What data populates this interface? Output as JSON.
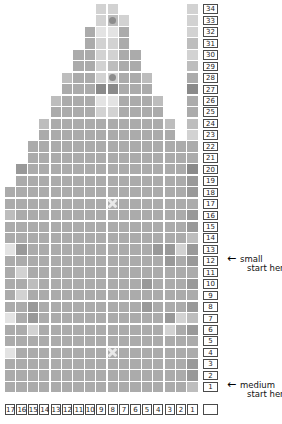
{
  "chart_data": {
    "type": "heatmap",
    "title": "",
    "subtitle": "",
    "xlabel": "",
    "ylabel": "",
    "grid": true,
    "legend_position": "right",
    "row_labels": [
      "34",
      "33",
      "32",
      "31",
      "30",
      "29",
      "28",
      "27",
      "26",
      "25",
      "24",
      "23",
      "22",
      "21",
      "20",
      "19",
      "18",
      "17",
      "16",
      "15",
      "14",
      "13",
      "12",
      "11",
      "10",
      "9",
      "8",
      "7",
      "6",
      "5",
      "4",
      "3",
      "2",
      "1"
    ],
    "column_labels": [
      "17",
      "16",
      "15",
      "14",
      "13",
      "12",
      "11",
      "10",
      "9",
      "8",
      "7",
      "6",
      "5",
      "4",
      "3",
      "2",
      "1"
    ],
    "n_rows": 34,
    "n_cols": 17,
    "palette": {
      "light": "#e3e3e3",
      "pale": "#d2d2d2",
      "mid": "#bdbdbd",
      "base": "#ababab",
      "dark": "#999999",
      "darker": "#8a8a8a",
      "grid_line": "#ffffff",
      "label_border": "#4a4a4a",
      "text": "#111111",
      "marker_dot": "#8d8d8d",
      "marker_x": "#e9e9e9",
      "background": "#ffffff"
    },
    "markers": [
      {
        "row": 33,
        "col_index": 9,
        "symbol": "dot",
        "name": "circle-marker"
      },
      {
        "row": 28,
        "col_index": 9,
        "symbol": "dot",
        "name": "circle-marker"
      },
      {
        "row": 17,
        "col_index": 9,
        "symbol": "x",
        "name": "x-marker"
      },
      {
        "row": 4,
        "col_index": 9,
        "symbol": "x",
        "name": "x-marker"
      }
    ],
    "rows": [
      {
        "row": 34,
        "start": 8,
        "width": 2,
        "shades": [
          "pale",
          "pale"
        ]
      },
      {
        "row": 33,
        "start": 8,
        "width": 3,
        "shades": [
          "pale",
          "mid",
          "pale"
        ]
      },
      {
        "row": 32,
        "start": 7,
        "width": 4,
        "shades": [
          "base",
          "light",
          "light",
          "base"
        ]
      },
      {
        "row": 31,
        "start": 7,
        "width": 4,
        "shades": [
          "base",
          "pale",
          "pale",
          "base"
        ]
      },
      {
        "row": 30,
        "start": 6,
        "width": 6,
        "shades": [
          "base",
          "base",
          "pale",
          "pale",
          "base",
          "base"
        ]
      },
      {
        "row": 29,
        "start": 6,
        "width": 6,
        "shades": [
          "base",
          "base",
          "pale",
          "mid",
          "base",
          "base"
        ]
      },
      {
        "row": 28,
        "start": 5,
        "width": 8,
        "shades": [
          "mid",
          "base",
          "base",
          "pale",
          "pale",
          "base",
          "base",
          "mid"
        ]
      },
      {
        "row": 27,
        "start": 5,
        "width": 8,
        "shades": [
          "base",
          "base",
          "base",
          "darker",
          "darker",
          "base",
          "base",
          "base"
        ]
      },
      {
        "row": 26,
        "start": 4,
        "width": 10,
        "shades": [
          "mid",
          "base",
          "base",
          "base",
          "light",
          "light",
          "base",
          "base",
          "base",
          "mid"
        ]
      },
      {
        "row": 25,
        "start": 4,
        "width": 10,
        "shades": [
          "base",
          "base",
          "base",
          "base",
          "pale",
          "pale",
          "base",
          "base",
          "base",
          "base"
        ]
      },
      {
        "row": 24,
        "start": 3,
        "width": 12,
        "shades": [
          "mid",
          "base",
          "base",
          "base",
          "base",
          "base",
          "base",
          "base",
          "base",
          "base",
          "base",
          "mid"
        ]
      },
      {
        "row": 23,
        "start": 3,
        "width": 12,
        "shades": [
          "base",
          "base",
          "base",
          "base",
          "base",
          "base",
          "base",
          "base",
          "base",
          "base",
          "base",
          "base"
        ]
      },
      {
        "row": 22,
        "start": 2,
        "width": 14,
        "shades": [
          "base",
          "base",
          "base",
          "base",
          "base",
          "base",
          "base",
          "base",
          "base",
          "base",
          "base",
          "base",
          "base",
          "base"
        ]
      },
      {
        "row": 21,
        "start": 2,
        "width": 14,
        "shades": [
          "base",
          "base",
          "base",
          "base",
          "base",
          "base",
          "base",
          "base",
          "base",
          "base",
          "base",
          "base",
          "base",
          "base"
        ]
      },
      {
        "row": 20,
        "start": 1,
        "width": 16,
        "shades": [
          "dark",
          "base",
          "base",
          "base",
          "base",
          "base",
          "base",
          "base",
          "base",
          "base",
          "base",
          "base",
          "base",
          "base",
          "base",
          "dark"
        ]
      },
      {
        "row": 19,
        "start": 1,
        "width": 16,
        "shades": [
          "base",
          "base",
          "base",
          "base",
          "base",
          "base",
          "base",
          "base",
          "base",
          "base",
          "base",
          "base",
          "base",
          "base",
          "base",
          "base"
        ]
      },
      {
        "row": 18,
        "start": 0,
        "width": 17,
        "shades": [
          "base",
          "base",
          "base",
          "base",
          "base",
          "base",
          "base",
          "base",
          "base",
          "base",
          "base",
          "base",
          "base",
          "base",
          "base",
          "base",
          "base"
        ]
      },
      {
        "row": 17,
        "start": 0,
        "width": 17,
        "shades": [
          "base",
          "base",
          "base",
          "base",
          "base",
          "base",
          "base",
          "base",
          "base",
          "base",
          "base",
          "base",
          "base",
          "base",
          "base",
          "base",
          "base"
        ]
      },
      {
        "row": 16,
        "start": 0,
        "width": 17,
        "shades": [
          "mid",
          "base",
          "base",
          "base",
          "base",
          "base",
          "base",
          "base",
          "base",
          "base",
          "base",
          "base",
          "base",
          "base",
          "base",
          "base",
          "mid"
        ]
      },
      {
        "row": 15,
        "start": 0,
        "width": 17,
        "shades": [
          "base",
          "base",
          "base",
          "base",
          "base",
          "base",
          "base",
          "base",
          "base",
          "base",
          "base",
          "base",
          "base",
          "base",
          "base",
          "base",
          "base"
        ]
      },
      {
        "row": 14,
        "start": 0,
        "width": 17,
        "shades": [
          "base",
          "base",
          "base",
          "base",
          "base",
          "base",
          "base",
          "base",
          "base",
          "base",
          "base",
          "base",
          "base",
          "base",
          "base",
          "base",
          "base"
        ]
      },
      {
        "row": 13,
        "start": 0,
        "width": 17,
        "shades": [
          "light",
          "dark",
          "base",
          "base",
          "base",
          "base",
          "base",
          "base",
          "base",
          "base",
          "base",
          "base",
          "base",
          "dark",
          "dark",
          "pale",
          "light"
        ]
      },
      {
        "row": 12,
        "start": 0,
        "width": 17,
        "shades": [
          "base",
          "base",
          "base",
          "base",
          "base",
          "base",
          "base",
          "base",
          "base",
          "base",
          "base",
          "base",
          "base",
          "base",
          "dark",
          "base",
          "base"
        ]
      },
      {
        "row": 11,
        "start": 0,
        "width": 17,
        "shades": [
          "base",
          "pale",
          "base",
          "base",
          "base",
          "base",
          "base",
          "base",
          "base",
          "base",
          "base",
          "base",
          "base",
          "base",
          "base",
          "base",
          "base"
        ]
      },
      {
        "row": 10,
        "start": 0,
        "width": 17,
        "shades": [
          "base",
          "base",
          "mid",
          "base",
          "base",
          "base",
          "base",
          "base",
          "base",
          "base",
          "base",
          "base",
          "dark",
          "base",
          "base",
          "base",
          "base"
        ]
      },
      {
        "row": 9,
        "start": 0,
        "width": 17,
        "shades": [
          "base",
          "pale",
          "base",
          "base",
          "base",
          "base",
          "base",
          "base",
          "base",
          "base",
          "base",
          "base",
          "base",
          "base",
          "base",
          "base",
          "base"
        ]
      },
      {
        "row": 8,
        "start": 0,
        "width": 17,
        "shades": [
          "base",
          "base",
          "dark",
          "base",
          "base",
          "base",
          "base",
          "base",
          "base",
          "base",
          "base",
          "base",
          "dark",
          "base",
          "base",
          "base",
          "base"
        ]
      },
      {
        "row": 7,
        "start": 0,
        "width": 17,
        "shades": [
          "light",
          "base",
          "dark",
          "base",
          "base",
          "base",
          "base",
          "base",
          "base",
          "base",
          "base",
          "base",
          "base",
          "base",
          "dark",
          "pale",
          "light"
        ]
      },
      {
        "row": 6,
        "start": 0,
        "width": 17,
        "shades": [
          "base",
          "base",
          "pale",
          "base",
          "base",
          "base",
          "base",
          "base",
          "base",
          "base",
          "base",
          "base",
          "base",
          "base",
          "pale",
          "base",
          "base"
        ]
      },
      {
        "row": 5,
        "start": 0,
        "width": 17,
        "shades": [
          "base",
          "base",
          "base",
          "base",
          "base",
          "base",
          "base",
          "base",
          "base",
          "base",
          "base",
          "base",
          "base",
          "base",
          "base",
          "base",
          "base"
        ]
      },
      {
        "row": 4,
        "start": 0,
        "width": 17,
        "shades": [
          "light",
          "base",
          "base",
          "base",
          "base",
          "base",
          "base",
          "base",
          "base",
          "base",
          "base",
          "base",
          "base",
          "base",
          "base",
          "base",
          "light"
        ]
      },
      {
        "row": 3,
        "start": 0,
        "width": 17,
        "shades": [
          "base",
          "base",
          "base",
          "base",
          "base",
          "base",
          "base",
          "base",
          "base",
          "base",
          "base",
          "base",
          "base",
          "base",
          "base",
          "base",
          "base"
        ]
      },
      {
        "row": 2,
        "start": 0,
        "width": 17,
        "shades": [
          "base",
          "base",
          "base",
          "base",
          "base",
          "base",
          "base",
          "base",
          "base",
          "base",
          "base",
          "base",
          "base",
          "base",
          "base",
          "base",
          "base"
        ]
      },
      {
        "row": 1,
        "start": 0,
        "width": 17,
        "shades": [
          "base",
          "base",
          "base",
          "base",
          "base",
          "base",
          "base",
          "base",
          "base",
          "base",
          "base",
          "base",
          "base",
          "base",
          "base",
          "base",
          "base"
        ]
      }
    ],
    "row_swatch_shades": {
      "34": "pale",
      "33": "pale",
      "32": "pale",
      "31": "mid",
      "30": "pale",
      "29": "mid",
      "28": "base",
      "27": "darker",
      "26": "base",
      "25": "base",
      "24": "mid",
      "23": "pale",
      "22": "base",
      "21": "base",
      "20": "darker",
      "19": "dark",
      "18": "dark",
      "17": "base",
      "16": "dark",
      "15": "dark",
      "14": "mid",
      "13": "dark",
      "12": "dark",
      "11": "base",
      "10": "dark",
      "9": "base",
      "8": "dark",
      "7": "mid",
      "6": "dark",
      "5": "base",
      "4": "base",
      "3": "dark",
      "2": "dark",
      "1": "mid"
    },
    "annotations": [
      {
        "name": "small-start-annotation",
        "target_row": 12,
        "arrow": "←",
        "line1": "small",
        "line2": "start here"
      },
      {
        "name": "medium-start-annotation",
        "target_row": 1,
        "arrow": "←",
        "line1": "medium",
        "line2": "start here"
      }
    ]
  }
}
